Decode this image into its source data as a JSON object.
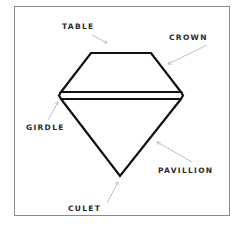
{
  "diagram": {
    "labels": {
      "table": "TABLE",
      "crown": "CROWN",
      "girdle": "GIRDLE",
      "pavillion": "PAVILLION",
      "culet": "CULET"
    },
    "colors": {
      "outline": "#111111",
      "arrow": "#b0b0b0",
      "frame": "#8a8a8a",
      "text": "#2a2a2a"
    }
  }
}
